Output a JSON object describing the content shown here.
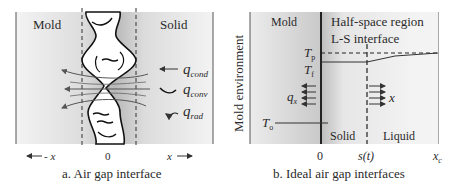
{
  "panel_a": {
    "caption": "a. Air gap interface",
    "region_left": "Mold",
    "region_right": "Solid",
    "axis_origin": "0",
    "axis_left": "- x",
    "axis_right": "x",
    "heat_labels": {
      "q": "q",
      "cond": "cond",
      "conv": "conv",
      "rad": "rad"
    }
  },
  "panel_b": {
    "caption": "b. Ideal air gap interfaces",
    "vertical_label": "Mold environment",
    "region_mold": "Mold",
    "region_title": "Half-space region",
    "interface_label": "L-S interface",
    "temp_p": {
      "T": "T",
      "sub": "p"
    },
    "temp_f": {
      "T": "T",
      "sub": "f"
    },
    "temp_o": {
      "T": "T",
      "sub": "o"
    },
    "flux": {
      "q": "q",
      "sub": "x"
    },
    "direction": "x",
    "solid_label": "Solid",
    "liquid_label": "Liquid",
    "tick_origin": "0",
    "tick_interface": "s(t)",
    "tick_end": {
      "x": "x",
      "sub": "c"
    }
  }
}
